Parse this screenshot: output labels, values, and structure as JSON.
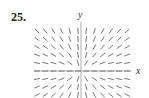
{
  "problem_number": "25.",
  "chart_data": {
    "type": "direction_field",
    "title": "",
    "xlabel": "x",
    "ylabel": "y",
    "slope_function": "y/x",
    "grid": {
      "columns": 12,
      "rows": 9
    },
    "x_range": [
      -6,
      6
    ],
    "y_range": [
      -3,
      5
    ],
    "axes": true,
    "gridlines": false,
    "legend": null
  },
  "colors": {
    "segments": "#666666",
    "axes": "#999999",
    "text": "#222222"
  }
}
